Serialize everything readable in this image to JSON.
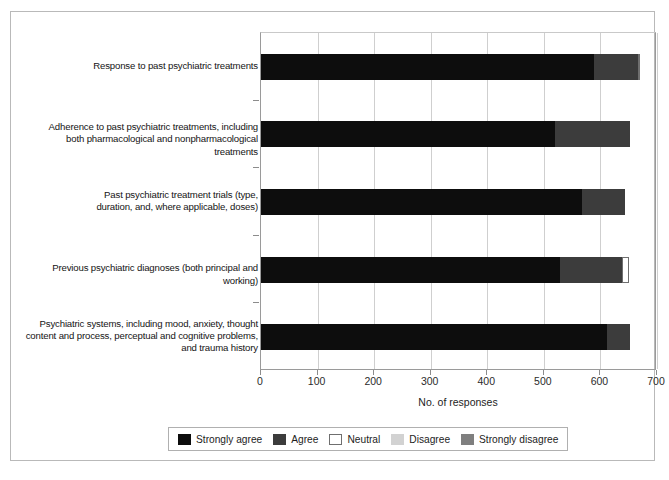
{
  "chart_data": {
    "type": "bar",
    "orientation": "horizontal",
    "stacked": true,
    "title": "",
    "xlabel": "No. of responses",
    "ylabel": "",
    "xlim": [
      0,
      700
    ],
    "xticks": [
      0,
      100,
      200,
      300,
      400,
      500,
      600,
      700
    ],
    "xtick_labels": [
      "0",
      "100",
      "200",
      "300",
      "400",
      "500",
      "600",
      "700"
    ],
    "grid": "vertical",
    "legend_position": "bottom",
    "categories": [
      "Response to past psychiatric treatments",
      "Adherence to past psychiatric treatments, including both pharmacological and nonpharmacological treatments",
      "Past psychiatric treatment trials (type, duration, and, where applicable, doses)",
      "Previous psychiatric diagnoses (both principal and working)",
      "Psychiatric systems, including mood, anxiety, thought content and process, perceptual and cognitive problems, and trauma history"
    ],
    "category_label_lines": [
      [
        "Response to past psychiatric treatments"
      ],
      [
        "Adherence to past psychiatric treatments, including",
        "both pharmacological and nonpharmacological treatments"
      ],
      [
        "Past psychiatric treatment trials (type,",
        "duration, and, where applicable, doses)"
      ],
      [
        "Previous psychiatric diagnoses (both principal and working)"
      ],
      [
        "Psychiatric systems, including mood, anxiety, thought",
        "content and process, perceptual and cognitive problems,",
        "and trauma history"
      ]
    ],
    "series": [
      {
        "name": "Strongly agree",
        "color": "#0d0d0d",
        "values": [
          588,
          520,
          567,
          528,
          612
        ]
      },
      {
        "name": "Agree",
        "color": "#3c3c3c",
        "values": [
          78,
          132,
          77,
          110,
          40
        ]
      },
      {
        "name": "Neutral",
        "color": "#ffffff",
        "values": [
          4,
          0,
          0,
          12,
          0
        ]
      },
      {
        "name": "Disagree",
        "color": "#d2d2d2",
        "values": [
          0,
          0,
          0,
          0,
          0
        ]
      },
      {
        "name": "Strongly disagree",
        "color": "#7f7f7f",
        "values": [
          0,
          0,
          0,
          0,
          0
        ]
      }
    ],
    "totals": [
      670,
      652,
      644,
      650,
      652
    ]
  },
  "legend": {
    "items": [
      {
        "label": "Strongly agree",
        "color": "#0d0d0d",
        "outlined": false
      },
      {
        "label": "Agree",
        "color": "#3c3c3c",
        "outlined": false
      },
      {
        "label": "Neutral",
        "color": "#ffffff",
        "outlined": true
      },
      {
        "label": "Disagree",
        "color": "#d2d2d2",
        "outlined": false
      },
      {
        "label": "Strongly disagree",
        "color": "#7f7f7f",
        "outlined": false
      }
    ]
  },
  "axis": {
    "x_title": "No. of responses"
  }
}
